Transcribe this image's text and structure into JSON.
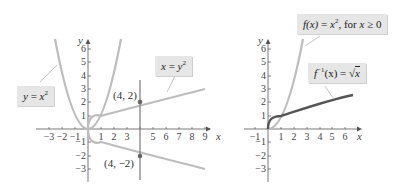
{
  "figure": {
    "left_panel": {
      "axis_x_label": "x",
      "axis_y_label": "y",
      "x_ticks": [
        "−3",
        "−2",
        "−1",
        "1",
        "2",
        "3",
        "5",
        "6",
        "7",
        "8",
        "9"
      ],
      "y_ticks": [
        "6",
        "5",
        "4",
        "3",
        "2",
        "1",
        "−1",
        "−2",
        "−3"
      ],
      "curves": [
        {
          "name": "y = x^2",
          "color": "#bdbdbd"
        },
        {
          "name": "x = y^2",
          "color": "#bdbdbd"
        }
      ],
      "vertical_line": {
        "x": 4,
        "color": "#7a7a7a"
      },
      "points": [
        {
          "label": "(4, 2)",
          "x": 4,
          "y": 2
        },
        {
          "label": "(4, −2)",
          "x": 4,
          "y": -2
        }
      ],
      "callouts": {
        "parabola": {
          "lhs": "y",
          "eq": " = ",
          "base": "x",
          "exp": "2"
        },
        "sideways": {
          "lhs": "x",
          "eq": " = ",
          "base": "y",
          "exp": "2"
        }
      }
    },
    "right_panel": {
      "axis_x_label": "x",
      "axis_y_label": "y",
      "x_ticks": [
        "−1",
        "1",
        "2",
        "3",
        "4",
        "5",
        "6"
      ],
      "y_ticks": [
        "6",
        "5",
        "4",
        "3",
        "2",
        "1",
        "−1",
        "−2",
        "−3"
      ],
      "curves": [
        {
          "name": "f(x) = x^2, for x ≥ 0",
          "color": "#bdbdbd"
        },
        {
          "name": "f^-1(x) = √x",
          "color": "#555555"
        }
      ],
      "callouts": {
        "f": {
          "fx": "f(x)",
          "eq": " = ",
          "base": "x",
          "exp": "2",
          "rest": ", for ",
          "var": "x",
          "cond": " ≥ 0"
        },
        "finv": {
          "f": "f",
          "exp": "−1",
          "arg": "(x)",
          "eq": " = √",
          "var": "x"
        }
      }
    }
  }
}
